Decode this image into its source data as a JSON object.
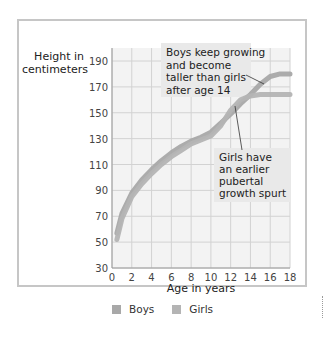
{
  "chart_data": {
    "type": "line",
    "title": "",
    "xlabel": "Age in years",
    "ylabel": "Height in centimeters",
    "xlim": [
      0,
      18
    ],
    "ylim": [
      30,
      200
    ],
    "x_ticks": [
      0,
      2,
      4,
      6,
      8,
      10,
      12,
      14,
      16,
      18
    ],
    "y_ticks": [
      30,
      50,
      70,
      90,
      110,
      130,
      150,
      170,
      190
    ],
    "grid": true,
    "legend_position": "bottom",
    "x": [
      0.5,
      1,
      2,
      3,
      4,
      5,
      6,
      7,
      8,
      9,
      10,
      11,
      12,
      13,
      14,
      15,
      16,
      17,
      18
    ],
    "series": [
      {
        "name": "Boys",
        "color": "#a8a8a8",
        "values": [
          57,
          72,
          88,
          98,
          106,
          113,
          119,
          124,
          128,
          131,
          135,
          142,
          149,
          157,
          164,
          172,
          178,
          180,
          180
        ]
      },
      {
        "name": "Girls",
        "color": "#b4b4b4",
        "values": [
          52,
          68,
          85,
          95,
          103,
          110,
          116,
          121,
          126,
          129,
          132,
          140,
          152,
          160,
          163,
          164,
          164,
          164,
          164
        ]
      }
    ],
    "annotations": [
      {
        "text": "Boys keep growing and become taller than girls after age 14",
        "points_to": {
          "x": 15,
          "y": 172
        }
      },
      {
        "text": "Girls have an earlier pubertal growth spurt",
        "points_to": {
          "x": 12.3,
          "y": 152
        }
      }
    ]
  },
  "labels": {
    "ylabel_line1": "Height in",
    "ylabel_line2": "centimeters",
    "xlabel": "Age in years",
    "legend_boys": "Boys",
    "legend_girls": "Girls",
    "anno_boys": [
      "Boys keep growing",
      "and become",
      "taller than girls",
      "after age 14"
    ],
    "anno_girls": [
      "Girls have",
      "an earlier",
      "pubertal",
      "growth spurt"
    ]
  }
}
